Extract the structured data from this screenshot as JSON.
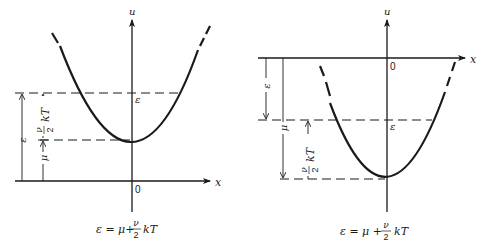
{
  "figures": [
    {
      "id": "left",
      "description": "Potential well above zero: minimum at mu above x-axis",
      "axis_labels": {
        "vertical": "u",
        "horizontal": "x",
        "origin": "0"
      },
      "level_label": "ε",
      "dimension_labels": {
        "epsilon": "ε",
        "mu": "μ",
        "nu_over_two_num": "ν",
        "nu_over_two_den": "2",
        "kT": "kT"
      },
      "caption": {
        "lhs": "ε = μ+",
        "frac_num": "ν",
        "frac_den": "2",
        "rhs": "kT"
      }
    },
    {
      "id": "right",
      "description": "Potential well below zero: minimum at mu below x-axis",
      "axis_labels": {
        "vertical": "u",
        "horizontal": "x",
        "origin": "0"
      },
      "level_label": "ε",
      "dimension_labels": {
        "epsilon": "ε",
        "mu": "μ",
        "nu_over_two_num": "ν",
        "nu_over_two_den": "2",
        "kT": "kT"
      },
      "caption": {
        "lhs": "ε = μ +",
        "frac_num": "ν",
        "frac_den": "2",
        "rhs": "kT"
      }
    }
  ]
}
